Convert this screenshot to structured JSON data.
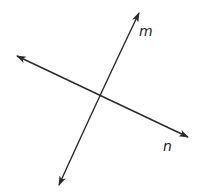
{
  "diagram": {
    "type": "intersecting-lines",
    "lines": [
      {
        "label": "m",
        "end_a": [
          139,
          13
        ],
        "end_b": [
          59,
          185
        ],
        "control": [
          104,
          86
        ],
        "label_pos": [
          145,
          36
        ]
      },
      {
        "label": "n",
        "end_a": [
          17,
          56
        ],
        "end_b": [
          188,
          137
        ],
        "label_pos": [
          163,
          150
        ]
      }
    ],
    "intersection": [
      100,
      97
    ],
    "line_color": "#2a2a2a",
    "background": "#ffffff"
  }
}
